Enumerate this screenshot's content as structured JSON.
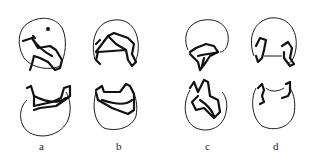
{
  "figure": {
    "panels": [
      {
        "id": "a",
        "label": "a"
      },
      {
        "id": "b",
        "label": "b"
      },
      {
        "id": "c",
        "label": "c"
      },
      {
        "id": "d",
        "label": "d"
      }
    ],
    "colors": {
      "background": "#ffffff",
      "ink": "#111111"
    }
  }
}
